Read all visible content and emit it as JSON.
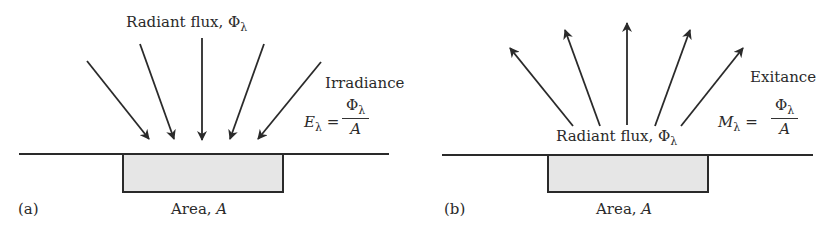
{
  "panel_a": {
    "label": "(a)",
    "title": "Radiant flux, Φ",
    "title_sub": "λ",
    "quantity": "Irradiance",
    "eq_lhs": "E",
    "eq_sub": "λ",
    "eq_equals": "=",
    "eq_num": "Φ",
    "eq_num_sub": "λ",
    "eq_den": "A",
    "area_label": "Area, ",
    "area_var": "A",
    "arrow_direction": "incoming"
  },
  "panel_b": {
    "label": "(b)",
    "title": "Radiant flux, Φ",
    "title_sub": "λ",
    "quantity": "Exitance",
    "eq_lhs": "M",
    "eq_sub": "λ",
    "eq_equals": "=",
    "eq_num": "Φ",
    "eq_num_sub": "λ",
    "eq_den": "A",
    "area_label": "Area, ",
    "area_var": "A",
    "arrow_direction": "outgoing"
  },
  "colors": {
    "line": "#2a2a2a",
    "area_fill": "#e6e6e6"
  }
}
